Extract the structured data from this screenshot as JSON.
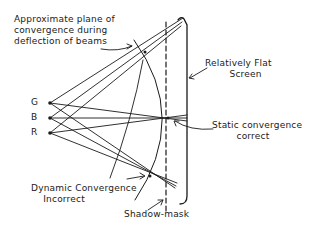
{
  "diagram": {
    "colors": {
      "ink": "#1a1a1a",
      "background": "#ffffff"
    },
    "guns": [
      {
        "id": "G",
        "label": "G",
        "x": 50,
        "y": 103
      },
      {
        "id": "B",
        "label": "B",
        "x": 50,
        "y": 118
      },
      {
        "id": "R",
        "label": "R",
        "x": 50,
        "y": 133
      }
    ],
    "convergence_points": {
      "top": {
        "x": 145,
        "y": 52
      },
      "middle": {
        "x": 168,
        "y": 118
      },
      "bottom": {
        "x": 150,
        "y": 176
      }
    },
    "labels": {
      "plane": "Approximate plane of\nconvergence during\ndeflection of beams",
      "screen": "Relatively Flat\n        Screen",
      "static": "Static convergence\n        correct",
      "dynamic": "Dynamic Convergence\n    Incorrect",
      "mask": "Shadow-mask"
    }
  }
}
